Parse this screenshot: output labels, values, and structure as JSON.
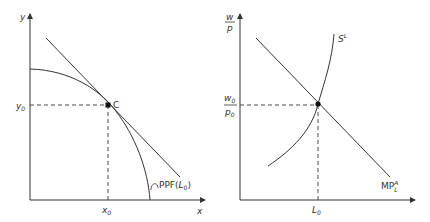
{
  "left_diagram": {
    "y_axis_label": "y",
    "x_axis_label": "x",
    "y_tick_label": "y",
    "y_tick_sub": "0",
    "x_tick_label": "x",
    "x_tick_sub": "0",
    "point_label": "C",
    "curve_label_main": "PPF(",
    "curve_label_var": "L",
    "curve_label_sub": "0",
    "curve_label_close": ")"
  },
  "right_diagram": {
    "y_axis_label_num": "w",
    "y_axis_label_den": "p",
    "y_tick_num": "w",
    "y_tick_num_sub": "0",
    "y_tick_den": "p",
    "y_tick_den_sub": "0",
    "x_tick_label": "L",
    "x_tick_sub": "0",
    "supply_label": "S",
    "supply_sup": "L",
    "demand_label": "MP",
    "demand_sup": "A",
    "demand_sub": "L"
  },
  "colors": {
    "line": "#333333",
    "background": "#ffffff"
  }
}
